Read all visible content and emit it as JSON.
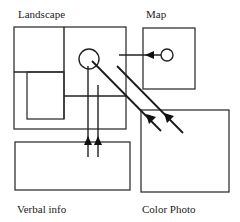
{
  "diagram": {
    "labels": {
      "landscape": "Landscape",
      "map": "Map",
      "verbal": "Verbal info",
      "color_photo": "Color Photo"
    },
    "colors": {
      "stroke": "#333333",
      "background": "#ffffff"
    }
  }
}
